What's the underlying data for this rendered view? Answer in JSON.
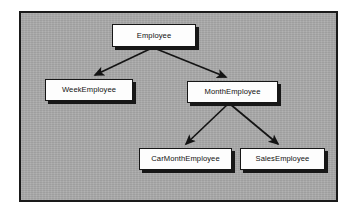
{
  "diagram": {
    "type": "class-inheritance-hierarchy",
    "canvas": {
      "background_color": "#a9a9a9",
      "border_color": "#1a1a1a",
      "page_background_color": "#ffffff"
    },
    "box_style": {
      "fill_color": "#fdfdfd",
      "border_color": "#161616",
      "shadow_color": "#171717"
    },
    "connector_style": {
      "line_color": "#141414",
      "arrowhead": "solid-filled-triangle"
    },
    "nodes": [
      {
        "id": "employee",
        "label": "Employee",
        "x": 112,
        "y": 24,
        "width": 84,
        "height": 23
      },
      {
        "id": "week-employee",
        "label": "WeekEmployee",
        "x": 45,
        "y": 79,
        "width": 88,
        "height": 22
      },
      {
        "id": "month-employee",
        "label": "MonthEmployee",
        "x": 187,
        "y": 81,
        "width": 91,
        "height": 22
      },
      {
        "id": "car-month-employee",
        "label": "CarMonthEmployee",
        "x": 139,
        "y": 148,
        "width": 93,
        "height": 22
      },
      {
        "id": "sales-employee",
        "label": "SalesEmployee",
        "x": 240,
        "y": 148,
        "width": 85,
        "height": 22
      }
    ],
    "edges": [
      {
        "id": "employee-to-week-employee",
        "from": "employee",
        "to": "week-employee",
        "relation": "generalization"
      },
      {
        "id": "employee-to-month-employee",
        "from": "employee",
        "to": "month-employee",
        "relation": "generalization"
      },
      {
        "id": "month-employee-to-car-month-employee",
        "from": "month-employee",
        "to": "car-month-employee",
        "relation": "generalization"
      },
      {
        "id": "month-employee-to-sales-employee",
        "from": "month-employee",
        "to": "sales-employee",
        "relation": "generalization"
      }
    ]
  }
}
